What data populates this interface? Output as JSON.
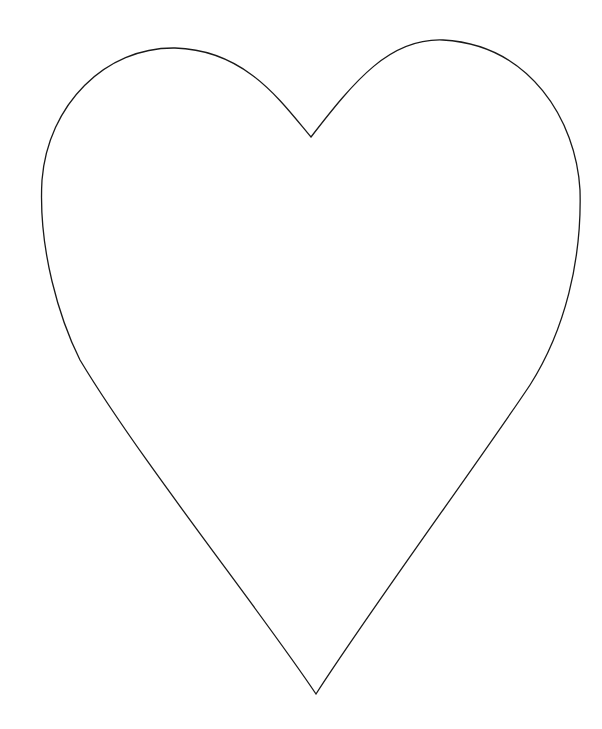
{
  "canvas": {
    "width": 602,
    "height": 729,
    "background": "#ffffff"
  },
  "shape": {
    "type": "heart-outline",
    "stroke_color": "#1a1a1a",
    "fill_color": "#ffffff",
    "stroke_width": 1.3,
    "key_points": {
      "top_notch": [
        311,
        137
      ],
      "bottom_tip": [
        316,
        694
      ],
      "left_lobe_top": [
        175,
        48
      ],
      "right_lobe_top": [
        443,
        40
      ],
      "left_extreme": [
        42,
        185
      ],
      "right_extreme": [
        580,
        190
      ]
    }
  }
}
